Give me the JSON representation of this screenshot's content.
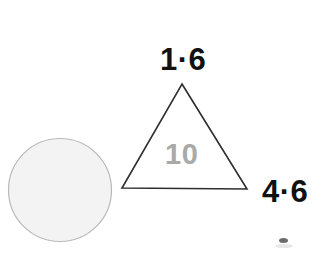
{
  "figure": {
    "background_color": "#ffffff",
    "width": 334,
    "height": 253,
    "shapes": {
      "circle": {
        "name": "shaded-circle",
        "center_x": 60,
        "center_y": 190,
        "radius": 52,
        "fill_color": "#f3f3f3",
        "stroke_color": "#b9b9b9"
      },
      "triangle": {
        "name": "measured-triangle",
        "apex_x": 182,
        "apex_y": 84,
        "base_left_x": 122,
        "base_left_y": 188,
        "base_right_x": 247,
        "base_right_y": 189,
        "fill_color": "#ffffff",
        "stroke_color": "#2e2e2e"
      }
    },
    "labels": {
      "top_measurement": "1·6",
      "right_measurement": "4·6",
      "inner_value": "10"
    },
    "label_colors": {
      "measurement": "#111111",
      "inner_value": "#a9a9a9"
    },
    "artifacts": {
      "bottom_right_mark": "partial-cut-off-mark"
    }
  }
}
